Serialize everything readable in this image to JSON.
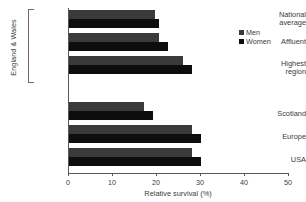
{
  "chart_data": {
    "type": "bar",
    "orientation": "horizontal",
    "title": "",
    "xlabel": "Relative survival (%)",
    "ylabel": "",
    "xlim": [
      0,
      50
    ],
    "xticks": [
      0,
      10,
      20,
      30,
      40,
      50
    ],
    "grid": false,
    "legend_position": "top-right",
    "categories": [
      "National\naverage",
      "Affluent",
      "Highest\nregion",
      "Scotland",
      "Europe",
      "USA"
    ],
    "series": [
      {
        "name": "Men",
        "color": "#3a3a3c",
        "values": [
          19.5,
          20.5,
          26.0,
          17.0,
          28.0,
          28.0
        ]
      },
      {
        "name": "Women",
        "color": "#0d0d0d",
        "values": [
          20.5,
          22.5,
          28.0,
          19.0,
          30.0,
          30.0
        ]
      }
    ],
    "group_bracket_label": "England & Wales",
    "group_bracket_categories": [
      "National\naverage",
      "Affluent",
      "Highest\nregion"
    ]
  },
  "legend": {
    "items": [
      {
        "label": "Men"
      },
      {
        "label": "Women"
      }
    ]
  },
  "axis": {
    "x_title": "Relative survival (%)",
    "tick_labels": [
      "0",
      "10",
      "20",
      "30",
      "40",
      "50"
    ]
  },
  "group_label": "England & Wales"
}
